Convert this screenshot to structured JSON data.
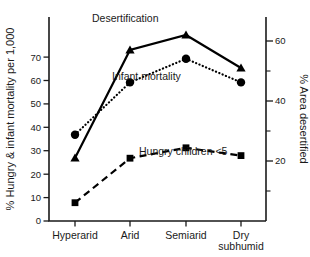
{
  "chart_data": {
    "type": "line",
    "title": "",
    "categories": [
      "Hyperarid",
      "Arid",
      "Semiarid",
      "Dry subhumid"
    ],
    "category_labels_multiline": [
      [
        "Hyperarid"
      ],
      [
        "Arid"
      ],
      [
        "Semiarid"
      ],
      [
        "Dry",
        "subhumid"
      ]
    ],
    "xlabel": "",
    "ylabel": "% Hungry & infant mortality per 1,000",
    "y2label": "% Area desertified",
    "ylim": [
      0,
      78
    ],
    "y2lim": [
      0,
      68
    ],
    "yticks": [
      0,
      10,
      20,
      30,
      40,
      50,
      60,
      70
    ],
    "ytick_labels": [
      "0",
      "10",
      "20",
      "30",
      "40",
      "50",
      "60",
      "70"
    ],
    "y2ticks": [
      10,
      20,
      30,
      40,
      50,
      60
    ],
    "y2tick_labels": [
      "",
      "20",
      "",
      "40",
      "",
      "60"
    ],
    "y2ticks_labeled": [
      20,
      40,
      60
    ],
    "grid": false,
    "legend_position": "inline-annotations",
    "series": [
      {
        "name": "Desertification",
        "axis": "right",
        "marker": "triangle",
        "linestyle": "solid",
        "color": "#000000",
        "values": [
          21,
          57,
          62,
          51
        ]
      },
      {
        "name": "Infant mortality",
        "axis": "left",
        "marker": "circle",
        "linestyle": "dotted",
        "color": "#000000",
        "values": [
          33,
          53,
          62,
          53
        ]
      },
      {
        "name": "Hungry children <5",
        "axis": "left",
        "marker": "square",
        "linestyle": "dashed",
        "color": "#000000",
        "values": [
          7,
          24,
          28,
          25
        ]
      }
    ],
    "annotations": [
      {
        "text": "Desertification",
        "x": 92,
        "y": 22
      },
      {
        "text": "Infant mortality",
        "x": 112,
        "y": 80
      },
      {
        "text": "Hungry children <5",
        "x": 139,
        "y": 155
      }
    ]
  }
}
